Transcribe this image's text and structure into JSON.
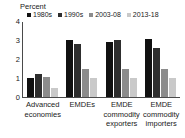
{
  "chart_data": {
    "type": "bar",
    "title": "",
    "subtitle": "",
    "unit_label": "Percent",
    "xlabel": "",
    "ylabel": "",
    "ylim": [
      0,
      4
    ],
    "yticks": [
      "0",
      "1",
      "2",
      "3",
      "4"
    ],
    "grid": false,
    "legend_position": "top",
    "categories": [
      "Advanced economies",
      "EMDEs",
      "EMDE commodity exporters",
      "EMDE commodity importers"
    ],
    "category_lines": [
      [
        "Advanced",
        "economies"
      ],
      [
        "EMDEs"
      ],
      [
        "EMDE",
        "commodity",
        "exporters"
      ],
      [
        "EMDE",
        "commodity",
        "importers"
      ]
    ],
    "series": [
      {
        "name": "1980s",
        "color": "#111111",
        "values": [
          1.0,
          3.05,
          2.95,
          3.1
        ]
      },
      {
        "name": "1990s",
        "color": "#2e2e2e",
        "values": [
          1.25,
          2.85,
          3.05,
          2.6
        ]
      },
      {
        "name": "2003-08",
        "color": "#8c8c8c",
        "values": [
          1.05,
          1.5,
          1.5,
          1.5
        ]
      },
      {
        "name": "2013-18",
        "color": "#c9c9c9",
        "values": [
          0.5,
          1.0,
          1.0,
          1.0
        ]
      }
    ]
  },
  "axis": {
    "tick_0": "0",
    "tick_1": "1",
    "tick_2": "2",
    "tick_3": "3",
    "tick_4": "4"
  },
  "labels": {
    "unit": "Percent",
    "cat0_l0": "Advanced",
    "cat0_l1": "economies",
    "cat1_l0": "EMDEs",
    "cat2_l0": "EMDE",
    "cat2_l1": "commodity",
    "cat2_l2": "exporters",
    "cat3_l0": "EMDE",
    "cat3_l1": "commodity",
    "cat3_l2": "importers"
  },
  "legend": {
    "items": [
      {
        "label": "1980s",
        "color": "#111111"
      },
      {
        "label": "1990s",
        "color": "#2e2e2e"
      },
      {
        "label": "2003-08",
        "color": "#8c8c8c"
      },
      {
        "label": "2013-18",
        "color": "#c9c9c9"
      }
    ]
  }
}
